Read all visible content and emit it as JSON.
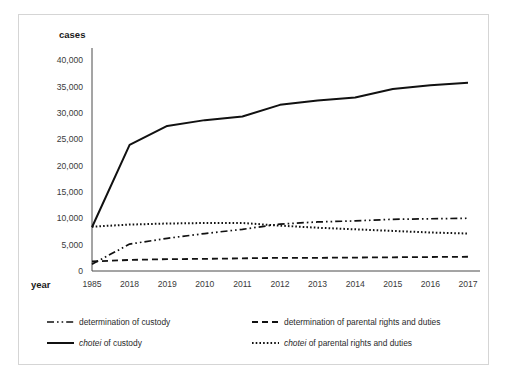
{
  "figure": {
    "background_color": "#ffffff",
    "frame_color": "#d5d5d5",
    "ink_color": "#111111"
  },
  "labels": {
    "y_axis_title": "cases",
    "x_axis_title": "year"
  },
  "chart_data": {
    "type": "line",
    "title": "",
    "subtitle": "",
    "xlabel": "year",
    "ylabel": "cases",
    "grid": false,
    "legend_position": "bottom",
    "ylim": [
      0,
      40000
    ],
    "yticks": [
      0,
      5000,
      10000,
      15000,
      20000,
      25000,
      30000,
      35000,
      40000
    ],
    "ytick_labels": [
      "0",
      "5,000",
      "10,000",
      "15,000",
      "20,000",
      "25,000",
      "30,000",
      "35,000",
      "40,000"
    ],
    "categories": [
      "1985",
      "2018",
      "2019",
      "2010",
      "2011",
      "2012",
      "2013",
      "2014",
      "2015",
      "2016",
      "2017"
    ],
    "series": [
      {
        "name": "determination of custody",
        "style": "dashdotdot",
        "values": [
          1300,
          5100,
          6200,
          7100,
          7900,
          8900,
          9300,
          9500,
          9800,
          9900,
          10000
        ]
      },
      {
        "name": "determination of parental rights and duties",
        "style": "dashed",
        "values": [
          1800,
          2100,
          2250,
          2300,
          2400,
          2500,
          2500,
          2550,
          2600,
          2650,
          2700
        ]
      },
      {
        "name": "chotei of custody",
        "style": "solid",
        "values": [
          8300,
          23900,
          27500,
          28600,
          29300,
          31500,
          32300,
          32900,
          34500,
          35200,
          35700
        ]
      },
      {
        "name": "chotei of parental rights and duties",
        "style": "dotted",
        "values": [
          8400,
          8800,
          9000,
          9100,
          9100,
          8600,
          8200,
          7900,
          7600,
          7300,
          7100
        ]
      }
    ]
  },
  "legend": [
    {
      "label": "determination of custody",
      "style": "dashdotdot",
      "italic_prefix": ""
    },
    {
      "label": "determination of parental rights and duties",
      "style": "dashed",
      "italic_prefix": ""
    },
    {
      "label": "of custody",
      "style": "solid",
      "italic_prefix": "chotei"
    },
    {
      "label": "of parental rights and duties",
      "style": "dotted",
      "italic_prefix": "chotei"
    }
  ]
}
